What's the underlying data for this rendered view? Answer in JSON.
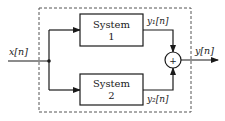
{
  "diagram": {
    "input_label": "x[n]",
    "output_label": "y[n]",
    "system1": {
      "line1": "System",
      "line2": "1"
    },
    "system2": {
      "line1": "System",
      "line2": "2"
    },
    "y1_label": "y₁[n]",
    "y2_label": "y₂[n]",
    "sum_symbol": "+",
    "colors": {
      "stroke": "#1a1a1a",
      "dashed_border": "#555555",
      "background": "#ffffff"
    }
  }
}
